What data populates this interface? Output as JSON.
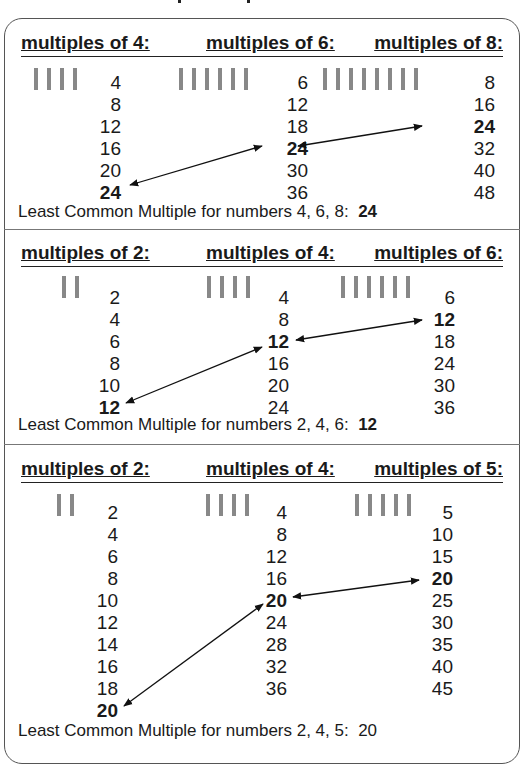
{
  "sections": [
    {
      "headers": [
        "multiples of 4:",
        "multiples of 6:",
        "multiples of 8:"
      ],
      "tally_counts": [
        4,
        6,
        8
      ],
      "columns": [
        {
          "values": [
            "4",
            "8",
            "12",
            "16",
            "20",
            "24"
          ],
          "highlight_index": 5
        },
        {
          "values": [
            "6",
            "12",
            "18",
            "24",
            "30",
            "36"
          ],
          "highlight_index": 3
        },
        {
          "values": [
            "8",
            "16",
            "24",
            "32",
            "40",
            "48"
          ],
          "highlight_index": 2
        }
      ],
      "lcm_label": "Least Common Multiple for numbers 4, 6, 8:",
      "lcm_value": "24",
      "lcm_value_bold": true
    },
    {
      "headers": [
        "multiples of 2:",
        "multiples of 4:",
        "multiples of 6:"
      ],
      "tally_counts": [
        2,
        4,
        6
      ],
      "columns": [
        {
          "values": [
            "2",
            "4",
            "6",
            "8",
            "10",
            "12"
          ],
          "highlight_index": 5
        },
        {
          "values": [
            "4",
            "8",
            "12",
            "16",
            "20",
            "24"
          ],
          "highlight_index": 2
        },
        {
          "values": [
            "6",
            "12",
            "18",
            "24",
            "30",
            "36"
          ],
          "highlight_index": 1
        }
      ],
      "lcm_label": "Least Common Multiple for numbers 2, 4, 6:",
      "lcm_value": "12",
      "lcm_value_bold": true
    },
    {
      "headers": [
        "multiples of 2:",
        "multiples of 4:",
        "multiples of 5:"
      ],
      "tally_counts": [
        2,
        4,
        5
      ],
      "columns": [
        {
          "values": [
            "2",
            "4",
            "6",
            "8",
            "10",
            "12",
            "14",
            "16",
            "18",
            "20"
          ],
          "highlight_index": 9
        },
        {
          "values": [
            "4",
            "8",
            "12",
            "16",
            "20",
            "24",
            "28",
            "32",
            "36"
          ],
          "highlight_index": 4
        },
        {
          "values": [
            "5",
            "10",
            "15",
            "20",
            "25",
            "30",
            "35",
            "40",
            "45"
          ],
          "highlight_index": 3
        }
      ],
      "lcm_label": "Least Common Multiple for numbers 2, 4, 5:",
      "lcm_value": "20",
      "lcm_value_bold": false
    }
  ],
  "colors": {
    "tally": "#888888",
    "text": "#1a1a1a",
    "border": "#555555"
  }
}
